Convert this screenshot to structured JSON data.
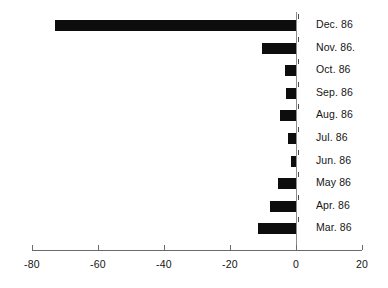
{
  "chart_data": {
    "type": "bar",
    "orientation": "horizontal",
    "title": "",
    "subtitle": "",
    "xlabel": "",
    "ylabel": "",
    "categories": [
      "Dec. 86",
      "Nov. 86.",
      "Oct. 86",
      "Sep. 86",
      "Aug. 86",
      "Jul. 86",
      "Jun. 86",
      "May 86",
      "Apr. 86",
      "Mar. 86"
    ],
    "values": [
      -73,
      -10.3,
      -3.3,
      -3,
      -5,
      -2.5,
      -1.5,
      -5.5,
      -8,
      -11.5
    ],
    "xlim": [
      -80,
      20
    ],
    "xticks": [
      -80,
      -60,
      -40,
      -20,
      0,
      20
    ],
    "xtick_labels": [
      "-80",
      "-60",
      "-40",
      "-20",
      "0",
      "20"
    ],
    "grid": false,
    "legend": null,
    "bar_color": "#0d0d0d",
    "axis_color": "#6b6b6b",
    "background": "#ffffff"
  },
  "layout": {
    "zero_x_px": 296,
    "px_per_unit": 3.3,
    "axis_left_px": 32,
    "axis_right_px": 362,
    "axis_y_px": 250,
    "first_row_top_px": 14,
    "row_step_px": 22.6,
    "label_left_px": 316
  }
}
